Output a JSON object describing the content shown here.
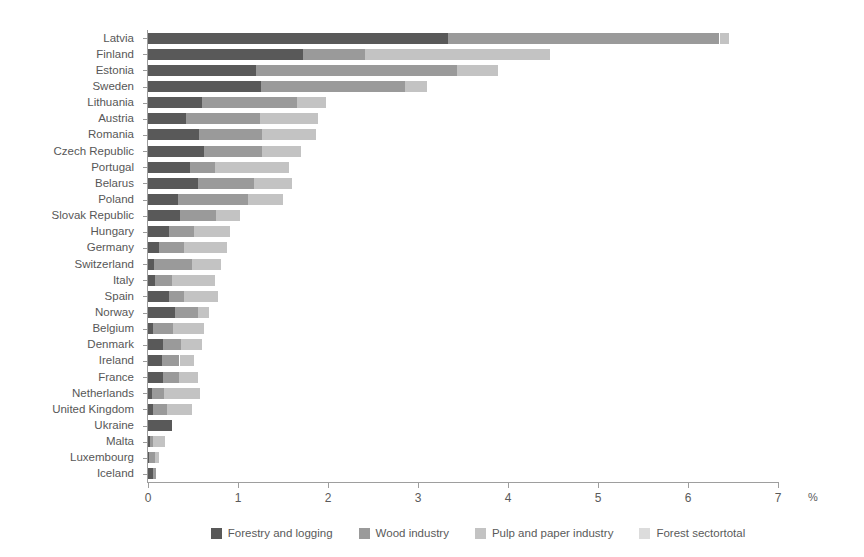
{
  "chart_data": {
    "type": "bar",
    "orientation": "horizontal",
    "stacked": true,
    "title": "",
    "xlabel": "%",
    "ylabel": "",
    "xlim": [
      0,
      7
    ],
    "xticks": [
      0,
      1,
      2,
      3,
      4,
      5,
      6,
      7
    ],
    "xtick_labels": [
      "0",
      "1",
      "2",
      "3",
      "4",
      "5",
      "6",
      "7"
    ],
    "grid": false,
    "legend_position": "bottom",
    "categories": [
      "Latvia",
      "Finland",
      "Estonia",
      "Sweden",
      "Lithuania",
      "Austria",
      "Romania",
      "Czech Republic",
      "Portugal",
      "Belarus",
      "Poland",
      "Slovak Republic",
      "Hungary",
      "Germany",
      "Switzerland",
      "Italy",
      "Spain",
      "Norway",
      "Belgium",
      "Denmark",
      "Ireland",
      "France",
      "Netherlands",
      "United Kingdom",
      "Ukraine",
      "Malta",
      "Luxembourg",
      "Iceland"
    ],
    "series": [
      {
        "name": "Forestry and logging",
        "color": "#595959",
        "values": [
          3.33,
          1.72,
          1.2,
          1.25,
          0.6,
          0.42,
          0.57,
          0.62,
          0.47,
          0.55,
          0.33,
          0.35,
          0.23,
          0.12,
          0.07,
          0.08,
          0.23,
          0.3,
          0.06,
          0.17,
          0.16,
          0.17,
          0.04,
          0.05,
          0.27,
          0.02,
          0.01,
          0.05
        ]
      },
      {
        "name": "Wood industry",
        "color": "#9a9a9a",
        "values": [
          3.02,
          0.69,
          2.23,
          1.6,
          1.05,
          0.82,
          0.7,
          0.65,
          0.27,
          0.63,
          0.78,
          0.4,
          0.28,
          0.28,
          0.42,
          0.19,
          0.17,
          0.26,
          0.22,
          0.2,
          0.19,
          0.17,
          0.14,
          0.16,
          0.0,
          0.04,
          0.07,
          0.04
        ]
      },
      {
        "name": "Pulp and paper industry",
        "color": "#c3c3c3",
        "values": [
          0.1,
          2.06,
          0.46,
          0.25,
          0.33,
          0.65,
          0.6,
          0.43,
          0.83,
          0.42,
          0.39,
          0.27,
          0.4,
          0.48,
          0.32,
          0.48,
          0.38,
          0.12,
          0.34,
          0.23,
          0.16,
          0.22,
          0.4,
          0.28,
          0.0,
          0.13,
          0.04,
          0.0
        ]
      },
      {
        "name": "Forest sectortotal",
        "color": "#dcdcdc",
        "values": [
          0.0,
          0.0,
          0.0,
          0.0,
          0.0,
          0.0,
          0.0,
          0.0,
          0.0,
          0.0,
          0.0,
          0.0,
          0.0,
          0.0,
          0.0,
          0.0,
          0.0,
          0.0,
          0.0,
          0.0,
          0.0,
          0.0,
          0.0,
          0.0,
          0.0,
          0.0,
          0.0,
          0.0
        ]
      }
    ],
    "totals": [
      6.45,
      4.47,
      3.89,
      3.1,
      1.98,
      1.89,
      1.87,
      1.7,
      1.57,
      1.6,
      1.5,
      1.02,
      0.91,
      0.88,
      0.81,
      0.75,
      0.78,
      0.68,
      0.62,
      0.6,
      0.51,
      0.56,
      0.58,
      0.49,
      0.27,
      0.19,
      0.12,
      0.09
    ],
    "legend": [
      {
        "label": "Forestry and logging",
        "color": "#595959"
      },
      {
        "label": "Wood industry",
        "color": "#9a9a9a"
      },
      {
        "label": "Pulp and paper industry",
        "color": "#c3c3c3"
      },
      {
        "label": "Forest sectortotal",
        "color": "#dcdcdc"
      }
    ]
  }
}
